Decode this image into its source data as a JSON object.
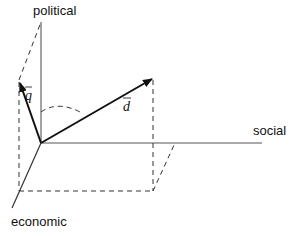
{
  "diagram": {
    "axes": {
      "vertical": "political",
      "horizontal": "social",
      "depth": "economic"
    },
    "vectors": [
      {
        "name": "q",
        "label": "q",
        "overline": true
      },
      {
        "name": "d",
        "label": "d",
        "overline": true
      }
    ],
    "colors": {
      "axis": "#555555",
      "vector": "#111111",
      "dashed": "#333333",
      "text": "#111111"
    }
  }
}
